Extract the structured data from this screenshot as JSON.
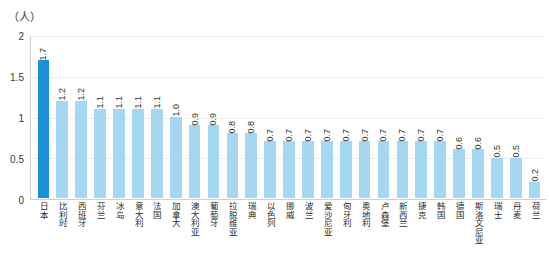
{
  "unit_label": "（人）",
  "chart_data": {
    "type": "bar",
    "title": "",
    "xlabel": "",
    "ylabel": "（人）",
    "ylim": [
      0,
      2
    ],
    "yticks": [
      "0",
      "0.5",
      "1",
      "1.5",
      "2"
    ],
    "grid": true,
    "legend": "none",
    "highlight_index": 0,
    "highlight_color": "#1f8fd6",
    "bar_color": "#a6d7f2",
    "categories": [
      "日本",
      "比利时",
      "西班牙",
      "芬兰",
      "冰岛",
      "意大利",
      "法国",
      "加拿大",
      "澳大利亚",
      "葡萄牙",
      "拉脱维亚",
      "瑞典",
      "以色列",
      "挪威",
      "波兰",
      "爱沙尼亚",
      "匈牙利",
      "奥地利",
      "卢森堡",
      "新西兰",
      "捷克",
      "韩国",
      "德国",
      "斯洛文尼亚",
      "瑞士",
      "丹麦",
      "荷兰"
    ],
    "values": [
      1.7,
      1.2,
      1.2,
      1.1,
      1.1,
      1.1,
      1.1,
      1.0,
      0.9,
      0.9,
      0.8,
      0.8,
      0.7,
      0.7,
      0.7,
      0.7,
      0.7,
      0.7,
      0.7,
      0.7,
      0.7,
      0.7,
      0.6,
      0.6,
      0.5,
      0.5,
      0.2
    ],
    "value_labels": [
      "1.7",
      "1.2",
      "1.2",
      "1.1",
      "1.1",
      "1.1",
      "1.1",
      "1.0",
      "0.9",
      "0.9",
      "0.8",
      "0.8",
      "0.7",
      "0.7",
      "0.7",
      "0.7",
      "0.7",
      "0.7",
      "0.7",
      "0.7",
      "0.7",
      "0.7",
      "0.6",
      "0.6",
      "0.5",
      "0.5",
      "0.2"
    ]
  }
}
